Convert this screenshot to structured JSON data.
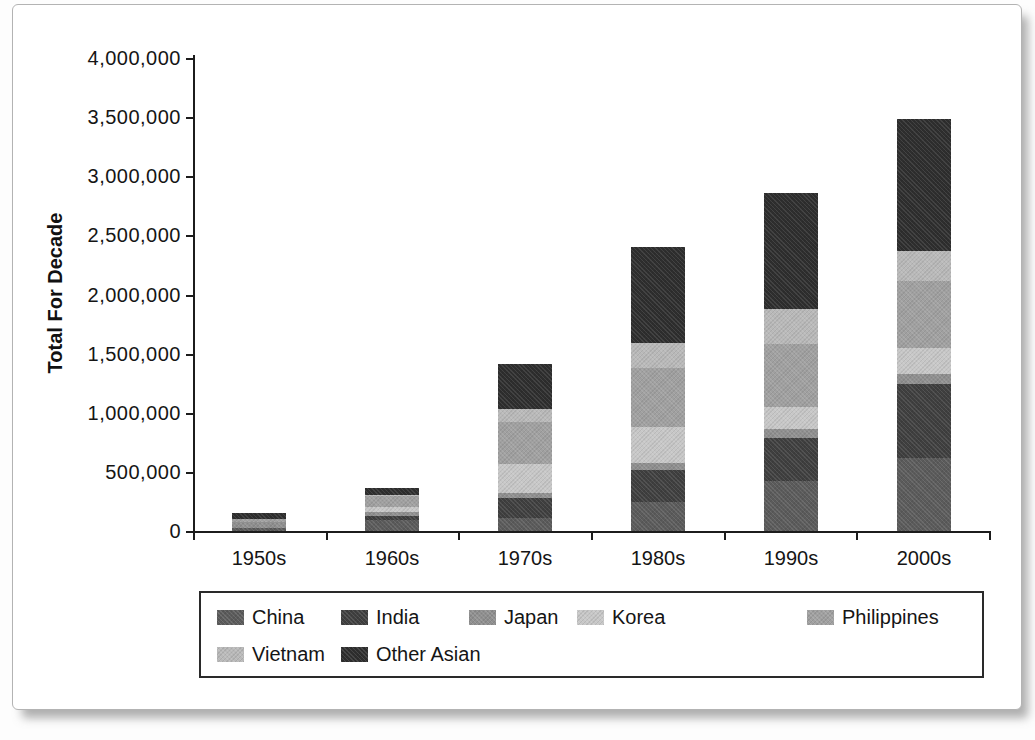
{
  "figure": {
    "background": "#ffffff",
    "frame_border_color": "#b3b3b3",
    "axis_color": "#1c1c1c"
  },
  "chart_data": {
    "type": "bar",
    "stacked": true,
    "title": "",
    "xlabel": "",
    "ylabel": "Total For Decade",
    "ylim": [
      0,
      4000000
    ],
    "y_tick_interval": 500000,
    "y_ticks": [
      {
        "value": 0,
        "label": "0"
      },
      {
        "value": 500000,
        "label": "500,000"
      },
      {
        "value": 1000000,
        "label": "1,000,000"
      },
      {
        "value": 1500000,
        "label": "1,500,000"
      },
      {
        "value": 2000000,
        "label": "2,000,000"
      },
      {
        "value": 2500000,
        "label": "2,500,000"
      },
      {
        "value": 3000000,
        "label": "3,000,000"
      },
      {
        "value": 3500000,
        "label": "3,500,000"
      },
      {
        "value": 4000000,
        "label": "4,000,000"
      }
    ],
    "categories": [
      "1950s",
      "1960s",
      "1970s",
      "1980s",
      "1990s",
      "2000s"
    ],
    "series": [
      {
        "name": "China",
        "color": "#5b5b5b",
        "values": [
          25000,
          97000,
          110000,
          245000,
          425000,
          615000
        ]
      },
      {
        "name": "India",
        "color": "#3f3f3f",
        "values": [
          2000,
          27000,
          170000,
          270000,
          365000,
          625000
        ]
      },
      {
        "name": "Japan",
        "color": "#8f8f8f",
        "values": [
          46000,
          40000,
          45000,
          60000,
          75000,
          85000
        ]
      },
      {
        "name": "Korea",
        "color": "#c7c7c7",
        "values": [
          6000,
          35000,
          240000,
          305000,
          180000,
          220000
        ]
      },
      {
        "name": "Philippines",
        "color": "#a0a0a0",
        "values": [
          19000,
          98000,
          355000,
          500000,
          540000,
          565000
        ]
      },
      {
        "name": "Vietnam",
        "color": "#b9b9b9",
        "values": [
          300,
          4000,
          115000,
          210000,
          295000,
          260000
        ]
      },
      {
        "name": "Other Asian",
        "color": "#2e2e2e",
        "values": [
          55000,
          63000,
          375000,
          810000,
          980000,
          1115000
        ]
      }
    ],
    "grid": false,
    "legend_position": "bottom"
  },
  "legend": {
    "entries": [
      "China",
      "India",
      "Japan",
      "Korea",
      "Philippines",
      "Vietnam",
      "Other Asian"
    ]
  }
}
